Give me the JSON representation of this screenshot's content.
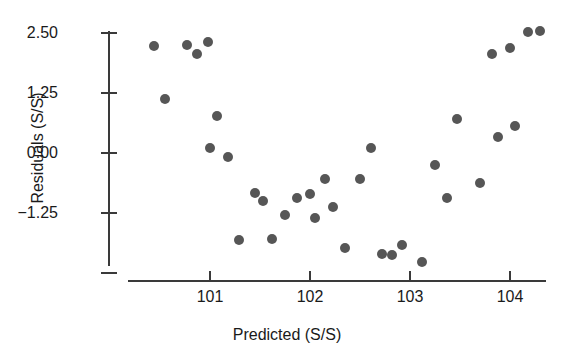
{
  "chart_data": {
    "type": "scatter",
    "title": "",
    "xlabel": "Predicted (S/S)",
    "ylabel": "Residuals (S/S)",
    "xlim": [
      100.28,
      104.35
    ],
    "ylim": [
      -2.58,
      2.78
    ],
    "grid": false,
    "legend": null,
    "marker": {
      "shape": "circle",
      "color": "#565656",
      "size_px": 10
    },
    "xticks": [
      101,
      102,
      103,
      104
    ],
    "xtick_labels": [
      "101",
      "102",
      "103",
      "104"
    ],
    "yticks": [
      2.5,
      1.25,
      0.0,
      -1.25,
      -2.5
    ],
    "ytick_labels": [
      "2.50",
      "1.25",
      "0.00",
      "-1.25",
      ""
    ],
    "points": [
      {
        "x": 100.44,
        "y": 2.22
      },
      {
        "x": 100.55,
        "y": 1.13
      },
      {
        "x": 100.77,
        "y": 2.25
      },
      {
        "x": 100.87,
        "y": 2.07
      },
      {
        "x": 100.98,
        "y": 2.31
      },
      {
        "x": 101.0,
        "y": 0.11
      },
      {
        "x": 101.07,
        "y": 0.78
      },
      {
        "x": 101.18,
        "y": -0.08
      },
      {
        "x": 101.29,
        "y": -1.81
      },
      {
        "x": 101.45,
        "y": -0.84
      },
      {
        "x": 101.53,
        "y": -1.0
      },
      {
        "x": 101.62,
        "y": -1.8
      },
      {
        "x": 101.75,
        "y": -1.3
      },
      {
        "x": 101.87,
        "y": -0.93
      },
      {
        "x": 102.0,
        "y": -0.85
      },
      {
        "x": 102.05,
        "y": -1.36
      },
      {
        "x": 102.15,
        "y": -0.55
      },
      {
        "x": 102.23,
        "y": -1.13
      },
      {
        "x": 102.35,
        "y": -1.98
      },
      {
        "x": 102.5,
        "y": -0.54
      },
      {
        "x": 102.61,
        "y": 0.1
      },
      {
        "x": 102.72,
        "y": -2.11
      },
      {
        "x": 102.82,
        "y": -2.13
      },
      {
        "x": 102.92,
        "y": -1.91
      },
      {
        "x": 103.12,
        "y": -2.28
      },
      {
        "x": 103.25,
        "y": -0.26
      },
      {
        "x": 103.37,
        "y": -0.93
      },
      {
        "x": 103.47,
        "y": 0.7
      },
      {
        "x": 103.7,
        "y": -0.63
      },
      {
        "x": 103.82,
        "y": 2.07
      },
      {
        "x": 103.88,
        "y": 0.33
      },
      {
        "x": 104.0,
        "y": 2.18
      },
      {
        "x": 104.05,
        "y": 0.57
      },
      {
        "x": 104.18,
        "y": 2.53
      },
      {
        "x": 104.3,
        "y": 2.55
      }
    ]
  }
}
